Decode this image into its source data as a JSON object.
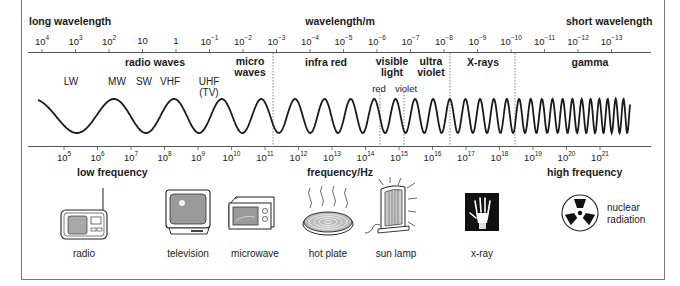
{
  "header": {
    "left_label": "long wavelength",
    "center_label": "wavelength/m",
    "right_label": "short wavelength"
  },
  "wavelength_axis": {
    "ticks": [
      {
        "base": "10",
        "exp": "4"
      },
      {
        "base": "10",
        "exp": "3"
      },
      {
        "base": "10",
        "exp": "2"
      },
      {
        "base": "10",
        "exp": ""
      },
      {
        "base": "1",
        "exp": ""
      },
      {
        "base": "10",
        "exp": "−1"
      },
      {
        "base": "10",
        "exp": "−2"
      },
      {
        "base": "10",
        "exp": "−3"
      },
      {
        "base": "10",
        "exp": "−4"
      },
      {
        "base": "10",
        "exp": "−5"
      },
      {
        "base": "10",
        "exp": "−6"
      },
      {
        "base": "10",
        "exp": "−7"
      },
      {
        "base": "10",
        "exp": "−8"
      },
      {
        "base": "10",
        "exp": "−9"
      },
      {
        "base": "10",
        "exp": "−10"
      },
      {
        "base": "10",
        "exp": "−11"
      },
      {
        "base": "10",
        "exp": "−12"
      },
      {
        "base": "10",
        "exp": "−13"
      }
    ]
  },
  "bands": {
    "radio": "radio waves",
    "micro_1": "micro",
    "micro_2": "waves",
    "infrared": "infra red",
    "visible_1": "visible",
    "visible_2": "light",
    "uv_1": "ultra",
    "uv_2": "violet",
    "xrays": "X-rays",
    "gamma": "gamma"
  },
  "sub_bands": {
    "lw": "LW",
    "mw": "MW",
    "sw": "SW",
    "vhf": "VHF",
    "uhf": "UHF",
    "tv": "(TV)",
    "red": "red",
    "violet": "violet"
  },
  "frequency_axis": {
    "ticks": [
      {
        "base": "10",
        "exp": "5"
      },
      {
        "base": "10",
        "exp": "6"
      },
      {
        "base": "10",
        "exp": "7"
      },
      {
        "base": "10",
        "exp": "8"
      },
      {
        "base": "10",
        "exp": "9"
      },
      {
        "base": "10",
        "exp": "10"
      },
      {
        "base": "10",
        "exp": "11"
      },
      {
        "base": "10",
        "exp": "12"
      },
      {
        "base": "10",
        "exp": "13"
      },
      {
        "base": "10",
        "exp": "14"
      },
      {
        "base": "10",
        "exp": "15"
      },
      {
        "base": "10",
        "exp": "16"
      },
      {
        "base": "10",
        "exp": "17"
      },
      {
        "base": "10",
        "exp": "18"
      },
      {
        "base": "10",
        "exp": "19"
      },
      {
        "base": "10",
        "exp": "20"
      },
      {
        "base": "10",
        "exp": "21"
      }
    ]
  },
  "footer": {
    "left_label": "low frequency",
    "center_label": "frequency/Hz",
    "right_label": "high frequency"
  },
  "examples": [
    {
      "icon": "radio-icon",
      "label": "radio"
    },
    {
      "icon": "television-icon",
      "label": "television"
    },
    {
      "icon": "microwave-icon",
      "label": "microwave"
    },
    {
      "icon": "hot-plate-icon",
      "label": "hot plate"
    },
    {
      "icon": "sun-lamp-icon",
      "label": "sun lamp"
    },
    {
      "icon": "x-ray-icon",
      "label": "x-ray"
    },
    {
      "icon": "radiation-icon",
      "label_1": "nuclear",
      "label_2": "radiation"
    }
  ],
  "colors": {
    "ink": "#1a1a1a",
    "frame": "#777777",
    "screen_grey": "#9a9a9a",
    "xray_bg": "#111111"
  }
}
